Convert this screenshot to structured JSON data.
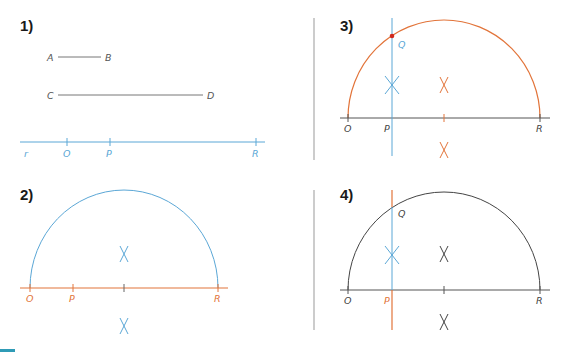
{
  "colors": {
    "blue": "#5ba7d6",
    "orange": "#e2743a",
    "dark": "#444444",
    "gray": "#999999",
    "point": "#d02a1e",
    "accent_bar": "#2f9bb6"
  },
  "panels": [
    {
      "number": "1)",
      "segments": [
        {
          "start_label": "A",
          "end_label": "B"
        },
        {
          "start_label": "C",
          "end_label": "D"
        }
      ],
      "line_label": "r",
      "points": [
        "O",
        "P",
        "R"
      ]
    },
    {
      "number": "2)",
      "points": [
        "O",
        "P",
        "R"
      ]
    },
    {
      "number": "3)",
      "points": [
        "O",
        "P",
        "R"
      ],
      "intersection": "Q"
    },
    {
      "number": "4)",
      "points": [
        "O",
        "P",
        "R"
      ],
      "intersection": "Q"
    }
  ]
}
